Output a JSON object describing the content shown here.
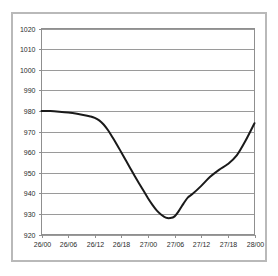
{
  "chart_data": {
    "type": "line",
    "title": "",
    "subtitle": "",
    "xlabel": "",
    "ylabel": "",
    "ylim": [
      920,
      1020
    ],
    "ytick_step": 10,
    "yticks": [
      1020,
      1010,
      1000,
      990,
      980,
      970,
      960,
      950,
      940,
      930,
      920
    ],
    "ytick_labels": [
      "1020",
      "1010",
      "1000",
      "990",
      "980",
      "970",
      "960",
      "950",
      "940",
      "930",
      "920"
    ],
    "categories": [
      "26/00",
      "26/06",
      "26/12",
      "26/18",
      "27/00",
      "27/06",
      "27/12",
      "27/18",
      "28/00"
    ],
    "xtick_labels": [
      "26/00",
      "26/06",
      "26/12",
      "26/18",
      "27/00",
      "27/06",
      "27/12",
      "27/18",
      "28/00"
    ],
    "xlim": [
      0,
      48
    ],
    "grid": true,
    "grid_axis": "y",
    "legend": false,
    "legend_position": "none",
    "series": [
      {
        "name": "pressure",
        "color": "#1a1a1a",
        "x": [
          0,
          2,
          4,
          6,
          8,
          10,
          11,
          12,
          13,
          14,
          15,
          16,
          17,
          18,
          19,
          20,
          21,
          22,
          23,
          24,
          25,
          26,
          27,
          28,
          29,
          30,
          31,
          32,
          33,
          34,
          36,
          38,
          40,
          42,
          44,
          46,
          48
        ],
        "values": [
          980.0,
          979.9,
          979.6,
          979.2,
          978.6,
          977.8,
          977.3,
          976.6,
          975.4,
          973.4,
          970.6,
          967.2,
          963.6,
          959.8,
          956.0,
          952.2,
          948.4,
          944.8,
          941.2,
          937.6,
          934.4,
          931.6,
          929.6,
          928.2,
          928.0,
          928.8,
          931.6,
          935.0,
          938.0,
          939.6,
          943.6,
          948.0,
          951.4,
          954.2,
          958.4,
          965.6,
          974.0
        ]
      }
    ]
  },
  "axis": {
    "y_min_label": "920",
    "y_max_label": "1020"
  }
}
